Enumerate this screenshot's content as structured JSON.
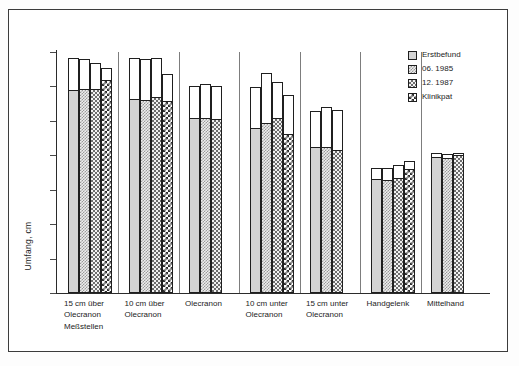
{
  "chart_data": {
    "type": "bar",
    "title": "",
    "subtitle": "",
    "xlabel": "Meßstellen",
    "ylabel": "Umfang, cm",
    "ylim": [
      0,
      35
    ],
    "yticks": [
      0,
      5,
      10,
      15,
      20,
      25,
      30,
      35
    ],
    "grid": false,
    "legend_position": "top-right",
    "legend": [
      "Erstbefund",
      "06. 1985",
      "12. 1987",
      "Klinikpat"
    ],
    "categories": [
      "15 cm über\nOlecranon",
      "10 cm über\nOlecranon",
      "Olecranon",
      "10 cm unter\nOlecranon",
      "15 cm unter\nOlecranon",
      "Handgelenk",
      "Mittelhand"
    ],
    "note": "Each bar is drawn as an outlined total height with a patterned fill rising to a lower level; 'total' is the bar outline top, 'value' is the patterned fill top.",
    "series": [
      {
        "name": "Erstbefund",
        "pattern": "solid-light-grey",
        "values": [
          29.3,
          28.1,
          25.3,
          23.8,
          21.0,
          16.4,
          19.6
        ],
        "totals": [
          34.2,
          34.1,
          30.1,
          29.9,
          26.5,
          18.1,
          20.3
        ]
      },
      {
        "name": "06. 1985",
        "pattern": "fine-checker",
        "values": [
          29.5,
          27.9,
          25.2,
          24.5,
          21.1,
          16.2,
          19.4
        ],
        "totals": [
          34.0,
          34.0,
          30.4,
          32.0,
          27.0,
          18.2,
          20.2
        ]
      },
      {
        "name": "12. 1987",
        "pattern": "medium-checker",
        "values": [
          29.5,
          28.3,
          25.1,
          25.3,
          20.6,
          16.6,
          19.9
        ],
        "totals": [
          33.4,
          34.1,
          30.1,
          30.6,
          26.6,
          18.6,
          20.4
        ]
      },
      {
        "name": "Klinikpat",
        "pattern": "coarse-checker",
        "values": [
          30.8,
          27.8,
          null,
          23.0,
          null,
          17.8,
          null
        ],
        "totals": [
          32.7,
          31.8,
          null,
          28.7,
          null,
          19.2,
          null
        ]
      }
    ]
  },
  "axis": {
    "y_tick_labels": [
      "0",
      "5",
      "10",
      "15",
      "20",
      "25",
      "30",
      "35"
    ],
    "y_axis_title": "Umfang, cm",
    "x_axis_title": "Meßstellen"
  },
  "legend": {
    "items": [
      {
        "label": "Erstbefund",
        "swatch": "solid-light-grey-swatch"
      },
      {
        "label": "06. 1985",
        "swatch": "fine-checker-swatch"
      },
      {
        "label": "12. 1987",
        "swatch": "medium-checker-swatch"
      },
      {
        "label": "Klinikpat",
        "swatch": "coarse-checker-swatch"
      }
    ]
  },
  "colors": {
    "axis": "#2b2b2b",
    "outline": "#1f1f1f",
    "separator": "#7d7d7d",
    "fill_light": "#d4d4d4",
    "background": "#ffffff",
    "frame": "#3c3c3c"
  }
}
